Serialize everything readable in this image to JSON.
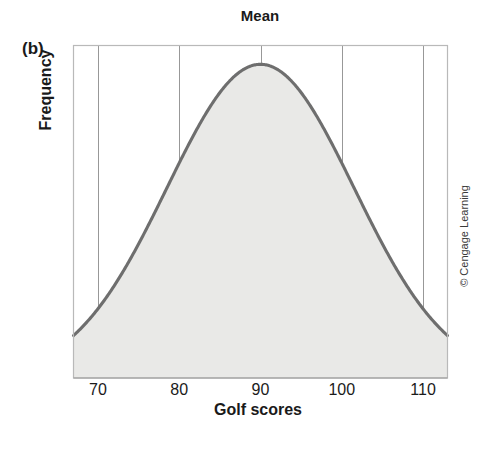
{
  "figure": {
    "panel_label": "(b)",
    "credit": "© Cengage Learning"
  },
  "chart_data": {
    "type": "line",
    "title": "Mean",
    "xlabel": "Golf scores",
    "ylabel": "Frequency",
    "xlim": [
      67,
      113
    ],
    "ylim": [
      0,
      1.06
    ],
    "grid": true,
    "legend": "none",
    "annotations": [
      {
        "text": "Mean",
        "x": 90,
        "note": "label above the vertical gridline at the distribution center"
      }
    ],
    "xticks": [
      70,
      80,
      90,
      100,
      110
    ],
    "xtick_labels": [
      "70",
      "80",
      "90",
      "100",
      "110"
    ],
    "yticks": [],
    "ytick_labels": [],
    "distribution": {
      "shape": "normal",
      "mean": 90,
      "std_dev": 11.5,
      "peak_height": 1.0,
      "fill_color": "#e9e9e7",
      "line_color": "#6e6e6e"
    },
    "x": [
      67,
      68,
      69,
      70,
      71,
      72,
      73,
      74,
      75,
      76,
      77,
      78,
      79,
      80,
      81,
      82,
      83,
      84,
      85,
      86,
      87,
      88,
      89,
      90,
      91,
      92,
      93,
      94,
      95,
      96,
      97,
      98,
      99,
      100,
      101,
      102,
      103,
      104,
      105,
      106,
      107,
      108,
      109,
      110,
      111,
      112,
      113
    ],
    "y": [
      0.031,
      0.039,
      0.049,
      0.061,
      0.075,
      0.091,
      0.111,
      0.133,
      0.159,
      0.188,
      0.221,
      0.257,
      0.298,
      0.342,
      0.389,
      0.44,
      0.493,
      0.548,
      0.604,
      0.66,
      0.714,
      0.766,
      0.813,
      0.855,
      0.891,
      0.92,
      0.941,
      0.954,
      0.959,
      0.954,
      0.941,
      0.92,
      0.891,
      0.855,
      0.813,
      0.766,
      0.714,
      0.66,
      0.604,
      0.548,
      0.493,
      0.44,
      0.389,
      0.342,
      0.298,
      0.257,
      0.221
    ]
  }
}
